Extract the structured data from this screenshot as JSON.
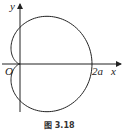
{
  "figure": {
    "caption": "图 3.18",
    "curve": "cardioid r = a(1 + cos θ)",
    "labels": {
      "x_axis": "x",
      "y_axis": "y",
      "origin": "O",
      "intercept": "2a"
    }
  },
  "chart_data": {
    "type": "line",
    "title": "图 3.18",
    "xlabel": "x",
    "ylabel": "y",
    "series": [
      {
        "name": "cardioid",
        "equation": "r = a(1 + cos θ)",
        "polar": true
      }
    ],
    "annotations": [
      "O",
      "2a"
    ],
    "key_points": [
      {
        "label": "O",
        "x": 0,
        "y": 0
      },
      {
        "label": "2a",
        "x": 2,
        "y": 0
      }
    ],
    "units": "a",
    "xlim": [
      -0.5,
      2.8
    ],
    "ylim": [
      -1.4,
      1.6
    ],
    "grid": false
  }
}
